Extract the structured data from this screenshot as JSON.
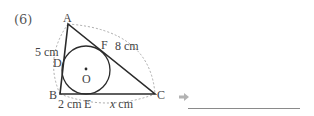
{
  "problem": {
    "number": "(6)"
  },
  "figure": {
    "vertices": {
      "A": "A",
      "B": "B",
      "C": "C"
    },
    "tangent_points": {
      "D": "D",
      "E": "E",
      "F": "F"
    },
    "center": "O",
    "lengths": {
      "AD": "5 cm",
      "AF": "8 cm",
      "BE": "2 cm",
      "EC_prefix": "x",
      "EC_unit": " cm"
    }
  },
  "answer": {
    "arrow_icon": "arrow-right-icon",
    "value": ""
  },
  "colors": {
    "stroke": "#2b2b2b",
    "dashed": "#9a9a9a",
    "arrow": "#b0b0b0"
  }
}
